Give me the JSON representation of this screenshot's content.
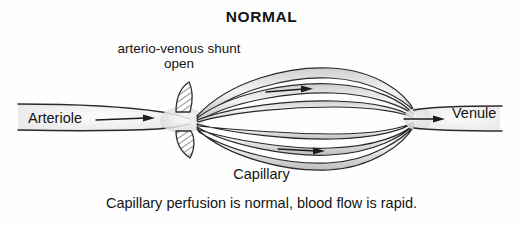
{
  "figure": {
    "title": "NORMAL",
    "caption": "Capillary perfusion is normal, blood flow is rapid.",
    "background_color": "#fefefe",
    "ink_color": "#141414"
  },
  "labels": {
    "shunt_line1": "arterio-venous shunt",
    "shunt_line2": "open",
    "arteriole": "Arteriole",
    "venule": "Venule",
    "capillary": "Capillary"
  },
  "diagram": {
    "type": "microcirculation-schematic",
    "vessel_count": 6,
    "flow_direction": "left-to-right",
    "flow_arrows": 4,
    "sphincter_wedges": 2,
    "sphincter_state": "open",
    "vessel_stroke_color": "#2a2a2a",
    "vessel_fill_color": "#f2f2f2",
    "hatch_color": "#3a3a3a"
  }
}
